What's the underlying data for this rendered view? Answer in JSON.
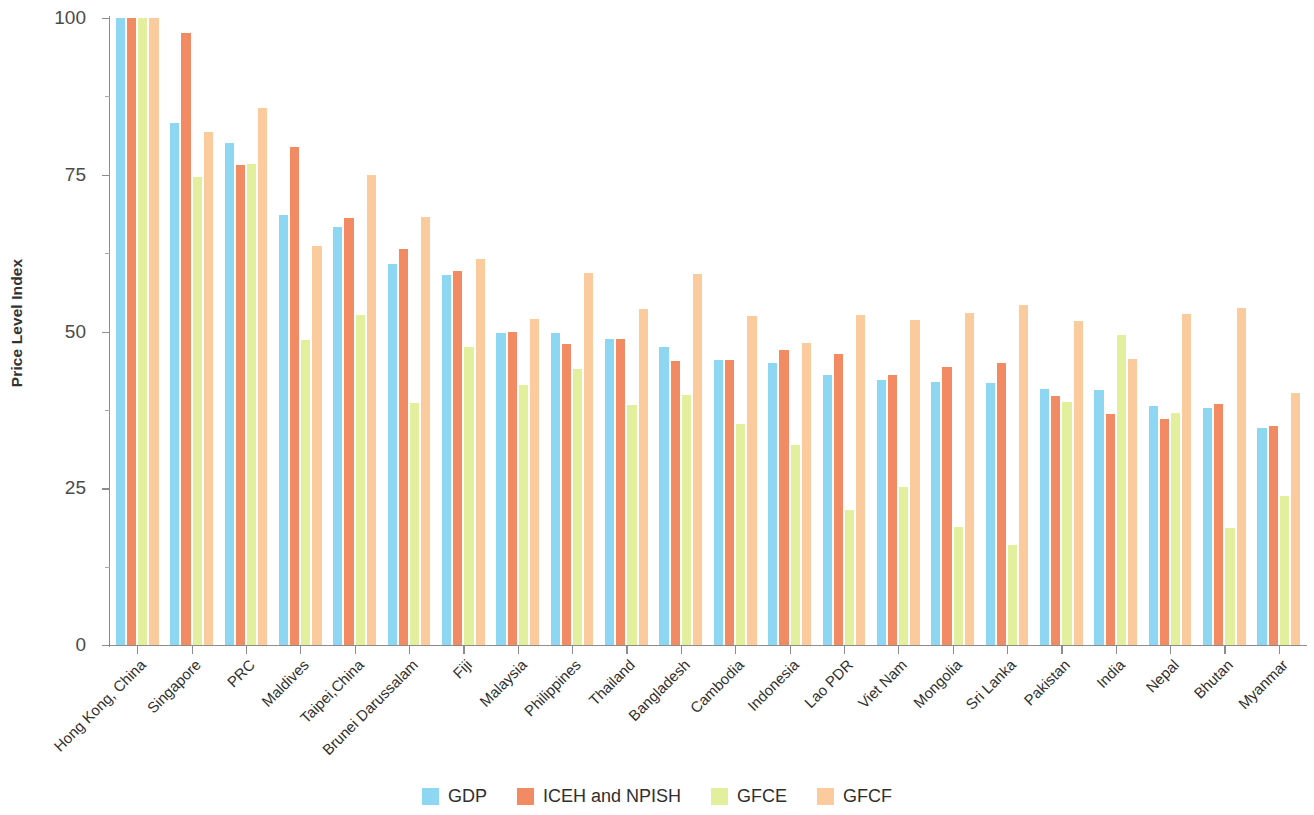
{
  "chart_data": {
    "type": "bar",
    "title": "",
    "xlabel": "",
    "ylabel": "Price Level Index",
    "ylim": [
      0,
      100
    ],
    "yticks": [
      0,
      25,
      50,
      75,
      100
    ],
    "ytick_labels": [
      "0",
      "25",
      "50",
      "75",
      "100"
    ],
    "grid": false,
    "legend_position": "bottom",
    "categories": [
      "Hong Kong, China",
      "Singapore",
      "PRC",
      "Maldives",
      "Taipei,China",
      "Brunei Darussalam",
      "Fiji",
      "Malaysia",
      "Philippines",
      "Thailand",
      "Bangladesh",
      "Cambodia",
      "Indonesia",
      "Lao PDR",
      "Viet Nam",
      "Mongolia",
      "Sri Lanka",
      "Pakistan",
      "India",
      "Nepal",
      "Bhutan",
      "Myanmar"
    ],
    "series": [
      {
        "name": "GDP",
        "color": "#8ed7f2",
        "values": [
          100,
          83.3,
          80.0,
          68.6,
          66.6,
          60.8,
          59.0,
          49.8,
          49.8,
          48.8,
          47.6,
          45.4,
          45.0,
          43.0,
          42.3,
          42.0,
          41.8,
          40.8,
          40.6,
          38.2,
          37.8,
          34.6
        ]
      },
      {
        "name": "ICEH and NPISH",
        "color": "#f28a63",
        "values": [
          100,
          97.6,
          76.5,
          79.5,
          68.1,
          63.1,
          59.7,
          50.0,
          48.0,
          48.8,
          45.3,
          45.5,
          47.0,
          46.4,
          43.1,
          44.4,
          44.9,
          39.7,
          36.9,
          36.0,
          38.5,
          35.0
        ]
      },
      {
        "name": "GFCE",
        "color": "#e2f09d",
        "values": [
          100,
          74.6,
          76.7,
          48.6,
          52.6,
          38.6,
          47.5,
          41.5,
          44.1,
          38.3,
          39.9,
          35.2,
          31.9,
          21.6,
          25.2,
          18.8,
          16.0,
          38.8,
          49.4,
          37.0,
          18.6,
          23.8
        ]
      },
      {
        "name": "GFCF",
        "color": "#fbcb9d",
        "values": [
          100,
          81.9,
          85.6,
          63.6,
          74.9,
          68.2,
          61.6,
          52.0,
          59.3,
          53.6,
          59.1,
          52.4,
          48.2,
          52.6,
          51.8,
          52.9,
          54.3,
          51.7,
          45.6,
          52.8,
          53.7,
          40.2
        ]
      }
    ]
  },
  "legend": {
    "items": [
      {
        "label": "GDP",
        "color": "#8ed7f2"
      },
      {
        "label": "ICEH and NPISH",
        "color": "#f28a63"
      },
      {
        "label": "GFCE",
        "color": "#e2f09d"
      },
      {
        "label": "GFCF",
        "color": "#fbcb9d"
      }
    ]
  }
}
